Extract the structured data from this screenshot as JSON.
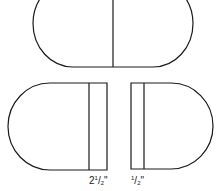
{
  "diagram": {
    "stroke_color": "#1a1a1a",
    "background": "#ffffff",
    "top_table": {
      "description": "Oval table top split down the middle",
      "x": 33,
      "y": -20,
      "width": 160,
      "height": 87,
      "radius": 40,
      "divider_x": 113
    },
    "bottom_left_half": {
      "description": "Left half with 2 1/2 inch apron strip",
      "x": 8,
      "y": 83,
      "width": 99,
      "height": 87,
      "strip_x": 89
    },
    "bottom_right_half": {
      "description": "Right half with 1/2 inch strip",
      "x": 131,
      "y": 83,
      "width": 82,
      "height": 86,
      "strip_x": 144
    },
    "labels": [
      {
        "whole": "2",
        "num": "1",
        "den": "2",
        "unit": "\""
      },
      {
        "whole": "",
        "num": "1",
        "den": "2",
        "unit": "\""
      }
    ]
  }
}
